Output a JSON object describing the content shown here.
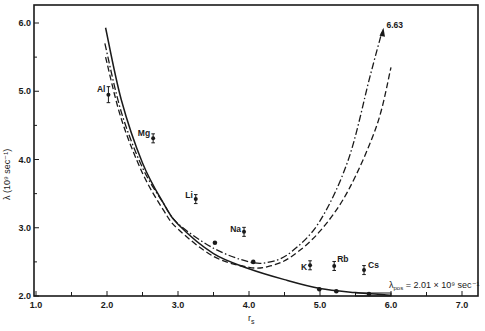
{
  "chart_data": {
    "type": "scatter",
    "title": "",
    "xlabel": "r_s",
    "ylabel": "λ (10⁹ sec⁻¹)",
    "xlim": [
      1.0,
      7.3
    ],
    "ylim": [
      2.0,
      6.2
    ],
    "grid": false,
    "x_ticks": [
      "1.0",
      "2.0",
      "3.0",
      "4.0",
      "5.0",
      "6.0",
      "7.0"
    ],
    "y_ticks": [
      "2.0",
      "3.0",
      "4.0",
      "5.0",
      "6.0"
    ],
    "experimental_points": [
      {
        "label": "Al",
        "x": 2.02,
        "y": 4.95
      },
      {
        "label": "Mg",
        "x": 2.65,
        "y": 4.31
      },
      {
        "label": "Li",
        "x": 3.25,
        "y": 3.42
      },
      {
        "label": "Na",
        "x": 3.93,
        "y": 2.94
      },
      {
        "label": "K",
        "x": 4.86,
        "y": 2.45
      },
      {
        "label": "Rb",
        "x": 5.2,
        "y": 2.44
      },
      {
        "label": "Cs",
        "x": 5.62,
        "y": 2.38
      }
    ],
    "series": [
      {
        "name": "solid curve",
        "style": "solid",
        "x": [
          1.98,
          2.2,
          2.5,
          2.8,
          3.0,
          3.5,
          4.0,
          4.5,
          5.0,
          5.5,
          6.0
        ],
        "y": [
          5.93,
          4.88,
          3.95,
          3.35,
          3.05,
          2.62,
          2.4,
          2.24,
          2.11,
          2.05,
          2.01
        ]
      },
      {
        "name": "dashed curve",
        "style": "dashed",
        "x": [
          1.98,
          2.2,
          2.5,
          2.8,
          3.0,
          3.5,
          4.0,
          4.3,
          4.6,
          5.0,
          5.4,
          5.8,
          6.0
        ],
        "y": [
          5.5,
          4.6,
          3.8,
          3.25,
          2.98,
          2.58,
          2.42,
          2.44,
          2.58,
          2.95,
          3.55,
          4.5,
          5.35
        ]
      },
      {
        "name": "dash-dot curve",
        "style": "dash-dot",
        "x": [
          1.97,
          2.2,
          2.5,
          2.8,
          3.0,
          3.5,
          4.0,
          4.3,
          4.6,
          5.0,
          5.4,
          5.7,
          5.88
        ],
        "y": [
          5.7,
          4.7,
          3.88,
          3.35,
          3.06,
          2.7,
          2.5,
          2.5,
          2.65,
          3.1,
          4.0,
          5.2,
          5.9
        ]
      }
    ],
    "curve_points": [
      {
        "x": 3.52,
        "y": 2.78
      },
      {
        "x": 4.06,
        "y": 2.5
      },
      {
        "x": 4.99,
        "y": 2.1
      },
      {
        "x": 5.23,
        "y": 2.07
      },
      {
        "x": 5.69,
        "y": 2.03
      }
    ],
    "annotations": [
      {
        "text": "6.63",
        "x": 5.9,
        "y": 5.95
      },
      {
        "text": "λpos = 2.01 × 10⁹ sec⁻¹",
        "x": 6.35,
        "y": 2.2
      }
    ]
  }
}
